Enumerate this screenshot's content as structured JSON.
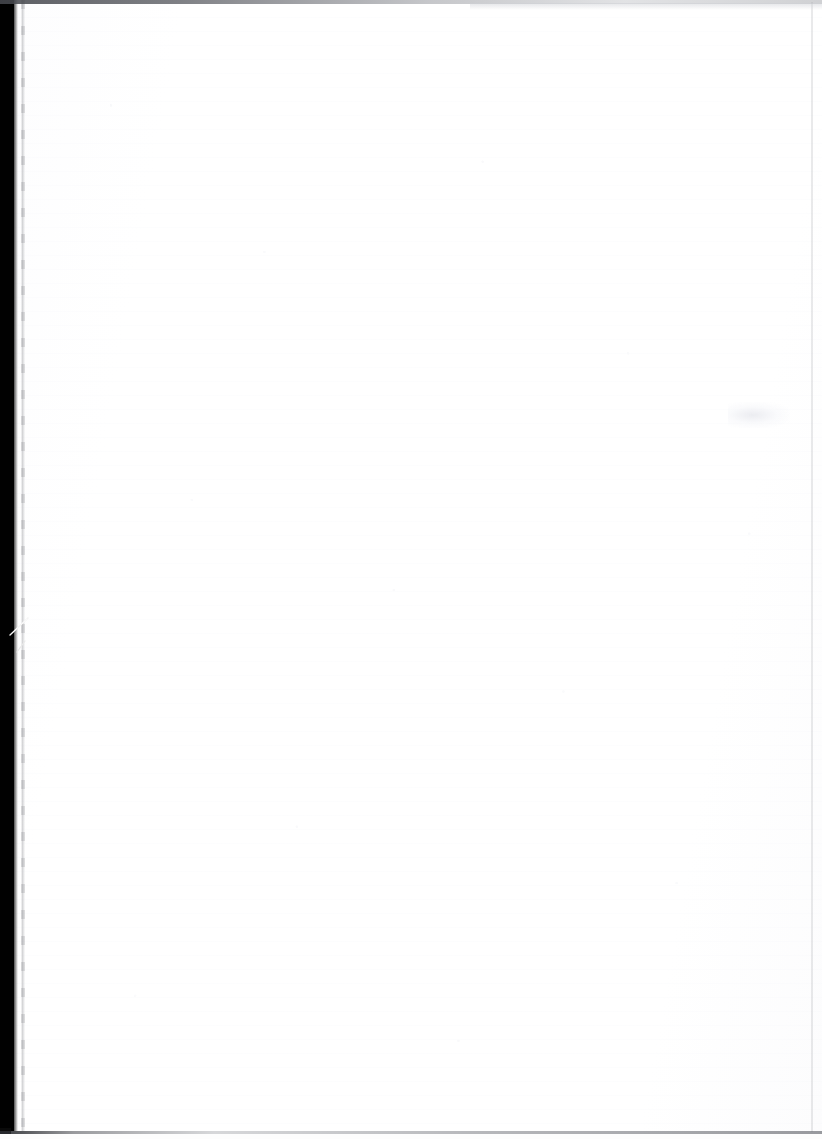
{
  "page": {
    "kind": "scanned-blank-page",
    "width": 822,
    "height": 1139,
    "text_content": "",
    "note": "",
    "colors": {
      "paper": "#ffffff",
      "scanner_bed": "#010101",
      "edge_rule": "#46484e",
      "edge_shadow": "#787a80",
      "smudge": "#e8e9ee"
    }
  },
  "artifacts": {
    "scanner_bed_left": {
      "label": "",
      "x": 0,
      "y": 0,
      "width": 14,
      "height": 1131
    },
    "diagonal_slash": {
      "label": "",
      "x": 6,
      "y": 614,
      "width": 26,
      "height": 40
    },
    "page_edge_shadow_left": {
      "label": "",
      "x": 21,
      "y": 0,
      "width": 4,
      "height": 1131
    },
    "page_edge_line_right": {
      "label": "",
      "x": 811,
      "y": 2,
      "width": 2,
      "height": 1130
    },
    "top_rule": {
      "label": "",
      "x": 0,
      "y": 0,
      "width": 822,
      "height": 4
    },
    "bottom_rule": {
      "label": "",
      "x": 0,
      "y": 1131,
      "width": 822,
      "height": 3
    },
    "faint_smudge": {
      "label": "",
      "x": 728,
      "y": 402,
      "width": 62,
      "height": 26
    }
  }
}
